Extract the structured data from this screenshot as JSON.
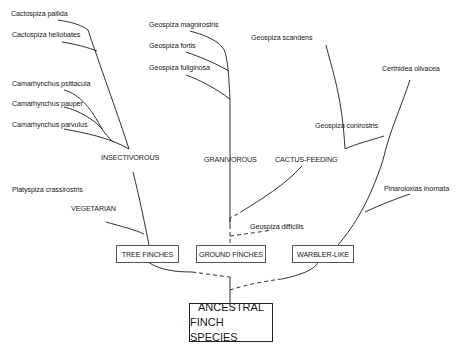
{
  "root": {
    "line1": "ANCESTRAL",
    "line2": "FINCH SPECIES"
  },
  "groups": [
    {
      "label": "TREE FINCHES"
    },
    {
      "label": "GROUND FINCHES"
    },
    {
      "label": "WARBLER-LIKE"
    }
  ],
  "diets": [
    {
      "label": "INSECTIVOROUS"
    },
    {
      "label": "VEGETARIAN"
    },
    {
      "label": "GRANIVOROUS"
    },
    {
      "label": "CACTUS-FEEDING"
    }
  ],
  "species": [
    {
      "name": "Cactospiza pallida"
    },
    {
      "name": "Cactospiza heliobates"
    },
    {
      "name": "Camarhynchus psittacula"
    },
    {
      "name": "Camarhynchus pauper"
    },
    {
      "name": "Camarhynchus parvulus"
    },
    {
      "name": "Platyspiza crassirostris"
    },
    {
      "name": "Geospiza magnirostris"
    },
    {
      "name": "Geospiza fortis"
    },
    {
      "name": "Geospiza fuliginosa"
    },
    {
      "name": "Geospiza scandens"
    },
    {
      "name": "Geospiza conirostris"
    },
    {
      "name": "Geospiza difficilis"
    },
    {
      "name": "Certhidea olivacea"
    },
    {
      "name": "Pinaroloxias inornata"
    }
  ]
}
